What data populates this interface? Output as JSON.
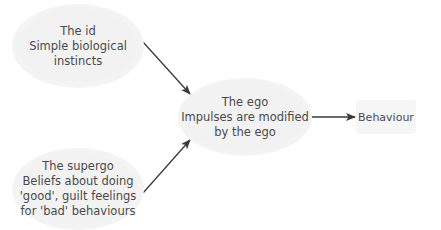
{
  "diagram": {
    "type": "flow",
    "nodes": {
      "id": {
        "title": "The id",
        "lines": [
          "Simple biological",
          "instincts"
        ]
      },
      "superego": {
        "title": "The supergo",
        "lines": [
          "Beliefs about doing",
          "'good', guilt feelings",
          "for 'bad' behaviours"
        ]
      },
      "ego": {
        "title": "The ego",
        "lines": [
          "Impulses are modified",
          "by the ego"
        ]
      },
      "behaviour": {
        "title": "Behaviour"
      }
    },
    "edges": [
      {
        "from": "id",
        "to": "ego"
      },
      {
        "from": "superego",
        "to": "ego"
      },
      {
        "from": "ego",
        "to": "behaviour"
      }
    ],
    "colors": {
      "node_fill": "#f2f2f2",
      "text": "#4a4a4a",
      "arrow": "#3a3a3a",
      "background": "#ffffff"
    }
  }
}
